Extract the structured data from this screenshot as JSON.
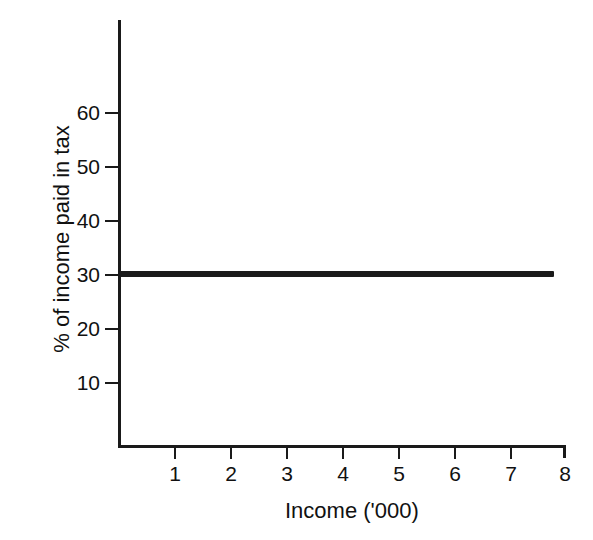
{
  "chart_data": {
    "type": "line",
    "title": "",
    "xlabel": "Income ('000)",
    "ylabel": "% of income paid in tax",
    "x": [
      0,
      1,
      2,
      3,
      4,
      5,
      6,
      7,
      7.8
    ],
    "series": [
      {
        "name": "Proportional tax rate",
        "values": [
          30,
          30,
          30,
          30,
          30,
          30,
          30,
          30,
          30
        ]
      }
    ],
    "xlim": [
      0,
      8
    ],
    "ylim": [
      0,
      70
    ],
    "x_ticks": [
      "1",
      "2",
      "3",
      "4",
      "5",
      "6",
      "7",
      "8"
    ],
    "x_tick_values": [
      1,
      2,
      3,
      4,
      5,
      6,
      7,
      8
    ],
    "y_ticks": [
      "10",
      "20",
      "30",
      "40",
      "50",
      "60"
    ],
    "y_tick_values": [
      10,
      20,
      30,
      40,
      50,
      60
    ],
    "grid": false,
    "legend": "none",
    "line_color": "#1a1a1a",
    "background_color": "#ffffff",
    "annotations": []
  },
  "axes": {
    "x_title": "Income ('000)",
    "y_title": "% of income paid in tax",
    "x_tick_labels": [
      "1",
      "2",
      "3",
      "4",
      "5",
      "6",
      "7",
      "8"
    ],
    "y_tick_labels": [
      "10",
      "20",
      "30",
      "40",
      "50",
      "60"
    ]
  }
}
